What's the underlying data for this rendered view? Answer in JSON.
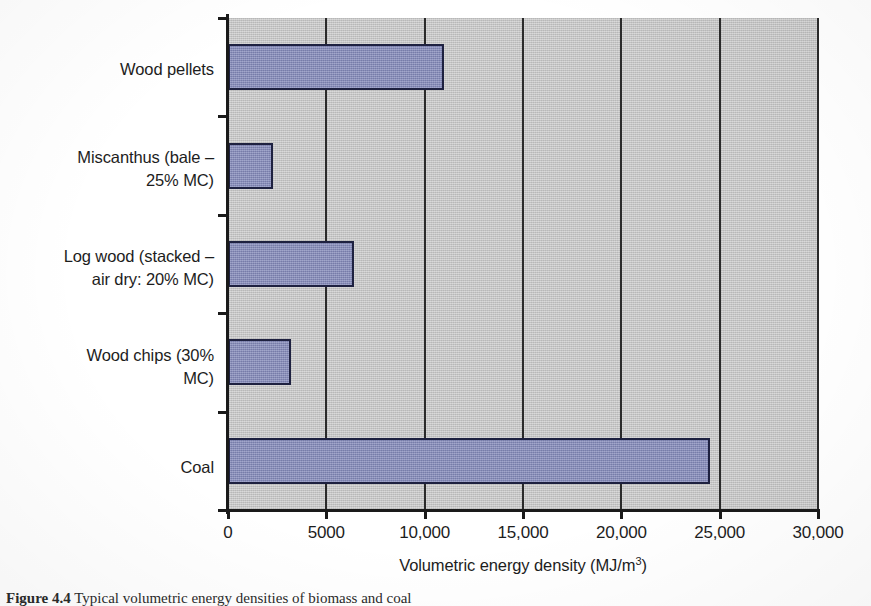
{
  "chart_data": {
    "type": "bar",
    "orientation": "horizontal",
    "title": "",
    "xlabel": "Volumetric energy density (MJ/m",
    "xlabel_sup": "3",
    "xlabel_tail": ")",
    "xlabel_full": "Volumetric energy density (MJ/m3)",
    "ylabel": "",
    "categories": [
      "Wood pellets",
      "Miscanthus (bale – 25% MC)",
      "Log wood (stacked – air dry: 20% MC)",
      "Wood chips (30% MC)",
      "Coal"
    ],
    "category_lines": [
      [
        "Wood pellets"
      ],
      [
        "Miscanthus (bale –",
        "25% MC)"
      ],
      [
        "Log wood (stacked –",
        "air dry: 20% MC)"
      ],
      [
        "Wood chips (30%",
        "MC)"
      ],
      [
        "Coal"
      ]
    ],
    "values": [
      11000,
      2300,
      6400,
      3200,
      24500
    ],
    "xlim": [
      0,
      30000
    ],
    "xticks": [
      0,
      5000,
      10000,
      15000,
      20000,
      25000,
      30000
    ],
    "xticklabels": [
      "0",
      "5000",
      "10,000",
      "15,000",
      "20,000",
      "25,000",
      "30,000"
    ],
    "grid": "vertical",
    "legend": "none",
    "units": "MJ/m3",
    "colors": {
      "bar_fill": "#8288b9",
      "bar_border": "#1e2140",
      "plot_background": "#c3c3c3",
      "gridline": "#2a2a2a",
      "axis": "#1a1a1a",
      "text": "#1d1d1d",
      "page_background": "#ffffff"
    }
  },
  "caption": {
    "label": "Figure 4.4",
    "text": "Typical volumetric energy densities of biomass and coal"
  }
}
